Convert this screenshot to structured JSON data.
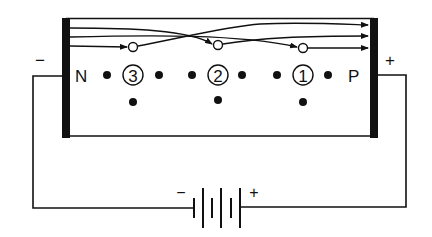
{
  "diagram": {
    "labels": {
      "n_region": "N",
      "p_region": "P",
      "left_terminal_sign": "−",
      "right_terminal_sign": "+",
      "battery_minus": "−",
      "battery_plus": "+"
    },
    "sites": [
      {
        "number": "3",
        "cx": 133,
        "cy": 75
      },
      {
        "number": "2",
        "cx": 218,
        "cy": 75
      },
      {
        "number": "1",
        "cx": 303,
        "cy": 75
      }
    ],
    "holes": [
      {
        "cx": 133,
        "cy": 47
      },
      {
        "cx": 218,
        "cy": 45
      },
      {
        "cx": 303,
        "cy": 48
      }
    ],
    "colors": {
      "ink": "#111111",
      "background": "#ffffff"
    }
  }
}
